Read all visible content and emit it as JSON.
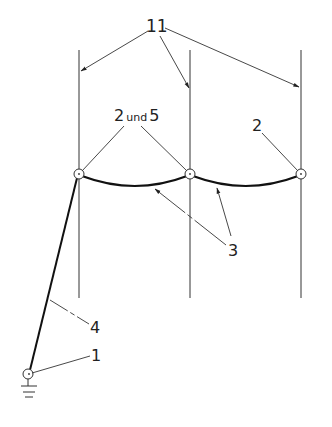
{
  "diagram": {
    "type": "patent-drawing",
    "labels": {
      "mast_lines": "11",
      "nodes_2_and_5": "2",
      "und": "und",
      "nodes_5": "5",
      "node_2": "2",
      "cables": "3",
      "guy": "4",
      "ground": "1"
    },
    "colors": {
      "line": "#222222",
      "background": "#ffffff"
    },
    "elements": [
      {
        "id": "11",
        "description": "three vertical lines (masts)"
      },
      {
        "id": "2 und 5",
        "description": "nodes on left and middle masts"
      },
      {
        "id": "2",
        "description": "node on right mast"
      },
      {
        "id": "3",
        "description": "sagging cables between nodes"
      },
      {
        "id": "4",
        "description": "guy line from ground anchor to left node"
      },
      {
        "id": "1",
        "description": "ground anchor node with earth symbol"
      }
    ]
  }
}
